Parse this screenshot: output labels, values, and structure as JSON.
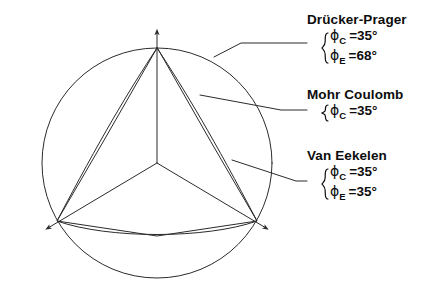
{
  "figure": {
    "kind": "deviatoric-plane-yield-surfaces",
    "background_color": "#ffffff",
    "line_color": "#2b2b2b",
    "geometry": {
      "center": [
        157,
        163
      ],
      "circle_radius": 115,
      "vertex_top": [
        157,
        48
      ],
      "vertex_bottom_left": [
        57,
        221
      ],
      "vertex_bottom_right": [
        257,
        221
      ],
      "axis_arrow_count": 3
    },
    "surfaces": [
      {
        "name": "Drücker-Prager",
        "shape": "circle"
      },
      {
        "name": "Mohr Coulomb",
        "shape": "irregular-hexagon-straight-edges"
      },
      {
        "name": "Van Eekelen",
        "shape": "rounded-triangle-curved-edges"
      }
    ]
  },
  "annotations": [
    {
      "id": "drucker-prager",
      "title": "Drücker-Prager",
      "params": [
        {
          "symbol": "ϕ",
          "sub": "C",
          "value": "=35°"
        },
        {
          "symbol": "ϕ",
          "sub": "E",
          "value": "=68°"
        }
      ]
    },
    {
      "id": "mohr-coulomb",
      "title": "Mohr Coulomb",
      "params": [
        {
          "symbol": "ϕ",
          "sub": "C",
          "value": "=35°"
        }
      ]
    },
    {
      "id": "van-eekelen",
      "title": "Van Eekelen",
      "params": [
        {
          "symbol": "ϕ",
          "sub": "C",
          "value": "=35°"
        },
        {
          "symbol": "ϕ",
          "sub": "E",
          "value": "=35°"
        }
      ]
    }
  ]
}
